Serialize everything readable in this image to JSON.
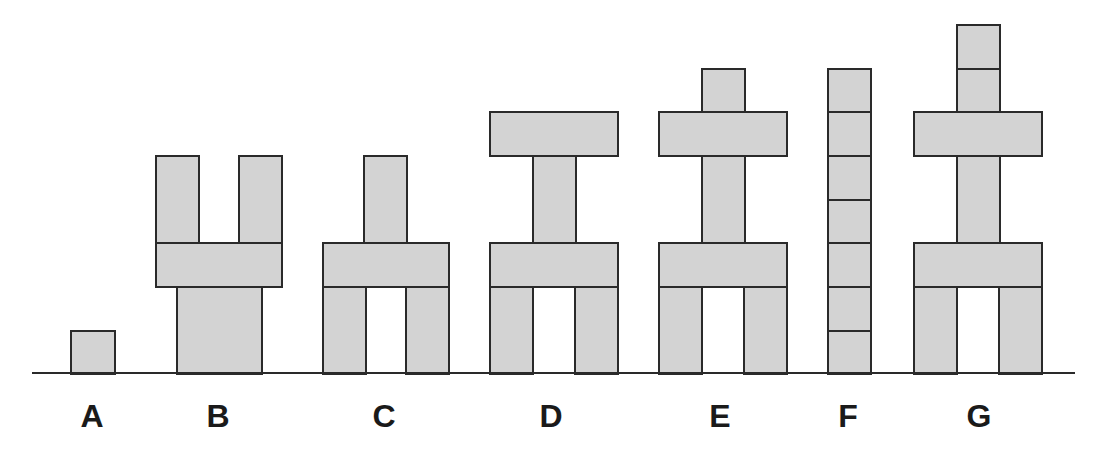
{
  "colors": {
    "block_fill": "#d3d3d3",
    "block_stroke": "#2a2a2a",
    "background": "#ffffff"
  },
  "baseline": {
    "x1": 32,
    "x2": 1075,
    "y": 373
  },
  "structures": [
    {
      "label": "A",
      "label_x": 92,
      "blocks": [
        [
          70,
          330,
          114,
          373
        ]
      ]
    },
    {
      "label": "B",
      "label_x": 218,
      "blocks": [
        [
          176,
          286,
          261,
          373
        ],
        [
          155,
          242,
          281,
          286
        ],
        [
          155,
          155,
          198,
          242
        ],
        [
          238,
          155,
          281,
          242
        ]
      ]
    },
    {
      "label": "C",
      "label_x": 384,
      "blocks": [
        [
          322,
          286,
          365,
          373
        ],
        [
          405,
          286,
          448,
          373
        ],
        [
          322,
          242,
          448,
          286
        ],
        [
          363,
          155,
          406,
          242
        ]
      ]
    },
    {
      "label": "D",
      "label_x": 551,
      "blocks": [
        [
          489,
          286,
          532,
          373
        ],
        [
          574,
          286,
          617,
          373
        ],
        [
          489,
          242,
          617,
          286
        ],
        [
          532,
          155,
          575,
          242
        ],
        [
          489,
          111,
          617,
          155
        ]
      ]
    },
    {
      "label": "E",
      "label_x": 720,
      "blocks": [
        [
          658,
          286,
          701,
          373
        ],
        [
          743,
          286,
          786,
          373
        ],
        [
          658,
          242,
          786,
          286
        ],
        [
          701,
          155,
          744,
          242
        ],
        [
          658,
          111,
          786,
          155
        ],
        [
          701,
          68,
          744,
          111
        ]
      ]
    },
    {
      "label": "F",
      "label_x": 848,
      "blocks": [
        [
          827,
          330,
          870,
          373
        ],
        [
          827,
          286,
          870,
          330
        ],
        [
          827,
          242,
          870,
          286
        ],
        [
          827,
          199,
          870,
          242
        ],
        [
          827,
          155,
          870,
          199
        ],
        [
          827,
          111,
          870,
          155
        ],
        [
          827,
          68,
          870,
          111
        ]
      ]
    },
    {
      "label": "G",
      "label_x": 979,
      "blocks": [
        [
          913,
          286,
          956,
          373
        ],
        [
          998,
          286,
          1041,
          373
        ],
        [
          913,
          242,
          1041,
          286
        ],
        [
          956,
          155,
          999,
          242
        ],
        [
          913,
          111,
          1041,
          155
        ],
        [
          956,
          68,
          999,
          111
        ],
        [
          956,
          24,
          999,
          68
        ]
      ]
    }
  ]
}
